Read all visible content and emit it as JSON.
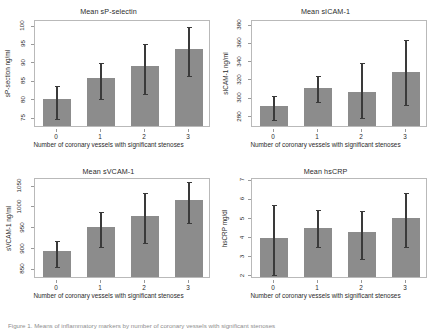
{
  "figure": {
    "caption_partial": "Figure 1. Means of inflammatory markers by number of coronary vessels with significant stenoses",
    "bar_color": "#8c8c8c",
    "error_color": "#3a3a3a",
    "axis_color": "#b9b9b9",
    "shared_xlabel": "Number of coronary vessels with significant stenoses",
    "shared_categories": [
      "0",
      "1",
      "2",
      "3"
    ]
  },
  "chart_data": [
    {
      "type": "bar",
      "panel": "top-left",
      "title": "Mean sP-selectin",
      "xlabel": "Number of coronary vessels with significant stenoses",
      "ylabel": "sP-section ng/ml",
      "categories": [
        "0",
        "1",
        "2",
        "3"
      ],
      "values": [
        79.8,
        85.5,
        88.8,
        93.3
      ],
      "error_low": [
        74.9,
        80.3,
        81.8,
        86.6
      ],
      "error_high": [
        83.8,
        90.2,
        95.3,
        100.0
      ],
      "yticks": [
        75,
        80,
        85,
        90,
        95,
        100
      ],
      "ylim": [
        72.5,
        101.5
      ],
      "grid": false
    },
    {
      "type": "bar",
      "panel": "top-right",
      "title": "Mean sICAM-1",
      "xlabel": "Number of coronary vessels with significant stenoses",
      "ylabel": "sICAM-1 ng/ml",
      "categories": [
        "0",
        "1",
        "2",
        "3"
      ],
      "values": [
        290,
        310,
        305,
        327
      ],
      "error_low": [
        277,
        296,
        279,
        293
      ],
      "error_high": [
        303,
        325,
        339,
        364
      ],
      "yticks": [
        280,
        300,
        320,
        340,
        360,
        380
      ],
      "ylim": [
        268,
        385
      ],
      "grid": false
    },
    {
      "type": "bar",
      "panel": "bottom-left",
      "title": "Mean sVCAM-1",
      "xlabel": "Number of coronary vessels with significant stenoses",
      "ylabel": "sVCAM-1 ng/ml",
      "categories": [
        "0",
        "1",
        "2",
        "3"
      ],
      "values": [
        890,
        948,
        975,
        1012
      ],
      "error_low": [
        856,
        905,
        915,
        963
      ],
      "error_high": [
        920,
        990,
        1035,
        1060
      ],
      "yticks": [
        850,
        900,
        950,
        1000,
        1050
      ],
      "ylim": [
        828,
        1068
      ],
      "grid": false
    },
    {
      "type": "bar",
      "panel": "bottom-right",
      "title": "Mean hsCRP",
      "xlabel": "Number of coronary vessels with significant stenoses",
      "ylabel": "hsCRP mg/dl",
      "categories": [
        "0",
        "1",
        "2",
        "3"
      ],
      "values": [
        3.9,
        4.4,
        4.2,
        4.95
      ],
      "error_low": [
        2.05,
        3.55,
        2.9,
        3.55
      ],
      "error_high": [
        5.75,
        5.45,
        5.4,
        6.35
      ],
      "yticks": [
        2,
        3,
        4,
        5,
        6,
        7
      ],
      "ylim": [
        1.85,
        7.1
      ],
      "grid": false
    }
  ]
}
